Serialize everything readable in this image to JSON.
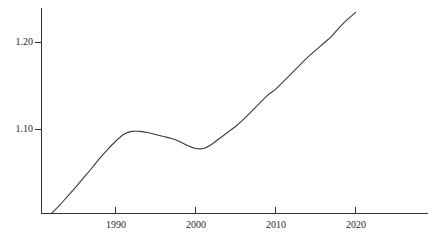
{
  "chart_data": {
    "type": "line",
    "title": "",
    "subtitle": "",
    "xlabel": "",
    "ylabel": "",
    "xlim": [
      1980.75,
      2029.4
    ],
    "ylim": [
      1.0035,
      1.2375
    ],
    "grid": false,
    "legend": null,
    "x_ticks": [
      1990,
      2000,
      2010,
      2020
    ],
    "x_tick_labels": [
      "1990",
      "2000",
      "2010",
      "2020"
    ],
    "y_ticks": [
      1.1,
      1.2
    ],
    "y_tick_labels": [
      "1.10",
      "1.20"
    ],
    "series": [
      {
        "name": "index",
        "x": [
          1982.0,
          1983.0,
          1984.0,
          1985.0,
          1986.0,
          1987.0,
          1988.0,
          1989.0,
          1990.0,
          1991.0,
          1992.0,
          1993.0,
          1994.0,
          1995.0,
          1996.0,
          1997.0,
          1998.0,
          1999.0,
          2000.0,
          2001.0,
          2002.0,
          2003.0,
          2004.0,
          2005.0,
          2006.0,
          2007.0,
          2008.0,
          2009.0,
          2010.0,
          2011.0,
          2012.0,
          2013.0,
          2014.0,
          2015.0,
          2016.0,
          2017.0,
          2018.0,
          2019.0,
          2020.0
        ],
        "values": [
          1.0035,
          1.0128,
          1.0232,
          1.0336,
          1.0444,
          1.0552,
          1.0666,
          1.077,
          1.0862,
          1.0943,
          1.0978,
          1.0978,
          1.0966,
          1.0943,
          1.092,
          1.0897,
          1.0862,
          1.0816,
          1.0782,
          1.0782,
          1.0828,
          1.0897,
          1.0966,
          1.1035,
          1.1116,
          1.1208,
          1.13,
          1.1392,
          1.1462,
          1.1552,
          1.1644,
          1.1736,
          1.1828,
          1.1909,
          1.1989,
          1.207,
          1.2173,
          1.2265,
          1.2345
        ]
      }
    ]
  },
  "axes": {
    "y_axis_name": "value-axis",
    "x_axis_name": "year-axis"
  }
}
